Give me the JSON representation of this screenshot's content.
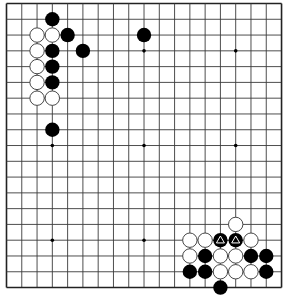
{
  "board": {
    "size": 19,
    "origin_x": 6.5,
    "origin_y": 3.5,
    "spacing_x": 15.28,
    "spacing_y": 15.78,
    "stone_radius": 7.2,
    "colors": {
      "background": "#ffffff",
      "line": "#3a3a3a",
      "border": "#222222",
      "black_stone": "#000000",
      "white_stone": "#ffffff",
      "white_outline": "#333333",
      "marker_on_black": "#ffffff"
    },
    "star_points": [
      [
        3,
        3
      ],
      [
        9,
        3
      ],
      [
        15,
        3
      ],
      [
        3,
        9
      ],
      [
        9,
        9
      ],
      [
        15,
        9
      ],
      [
        3,
        15
      ],
      [
        9,
        15
      ],
      [
        15,
        15
      ]
    ],
    "black_stones": [
      [
        3,
        1
      ],
      [
        4,
        2
      ],
      [
        3,
        3
      ],
      [
        5,
        3
      ],
      [
        3,
        4
      ],
      [
        3,
        5
      ],
      [
        3,
        8
      ],
      [
        9,
        2
      ],
      [
        14,
        15
      ],
      [
        15,
        15
      ],
      [
        13,
        16
      ],
      [
        16,
        16
      ],
      [
        17,
        16
      ],
      [
        12,
        17
      ],
      [
        13,
        17
      ],
      [
        17,
        17
      ],
      [
        14,
        18
      ]
    ],
    "white_stones": [
      [
        2,
        2
      ],
      [
        3,
        2
      ],
      [
        2,
        3
      ],
      [
        2,
        4
      ],
      [
        2,
        5
      ],
      [
        2,
        6
      ],
      [
        3,
        6
      ],
      [
        15,
        14
      ],
      [
        12,
        15
      ],
      [
        13,
        15
      ],
      [
        16,
        15
      ],
      [
        12,
        16
      ],
      [
        14,
        16
      ],
      [
        15,
        16
      ],
      [
        14,
        17
      ],
      [
        15,
        17
      ],
      [
        16,
        17
      ]
    ],
    "triangle_markers": [
      [
        14,
        15
      ],
      [
        15,
        15
      ]
    ]
  }
}
